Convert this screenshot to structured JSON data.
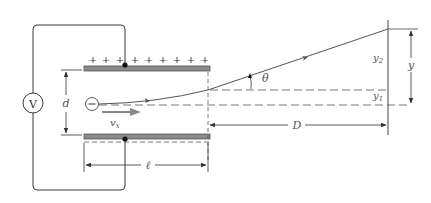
{
  "diagram": {
    "colors": {
      "line": "#3a3a3a",
      "plate_fill": "#8a8a8a",
      "plate_stroke": "#555555",
      "arrow": "#888888",
      "label": "#555555",
      "background": "#ffffff"
    },
    "voltmeter": {
      "label": "V"
    },
    "electron": {
      "symbol": "−"
    },
    "top_plate": {
      "charge_symbol": "+",
      "charge_count": 10
    },
    "labels": {
      "plate_separation": "d",
      "velocity": "v",
      "velocity_subscript": "x",
      "plate_length": "ℓ",
      "screen_distance": "D",
      "angle": "θ",
      "y_total": "y",
      "y1": "y",
      "y1_subscript": "1",
      "y2": "y",
      "y2_subscript": "2"
    }
  }
}
